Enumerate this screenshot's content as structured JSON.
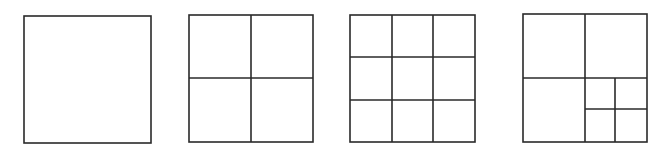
{
  "diagram": {
    "stroke_color": "#2a2a2a",
    "background_color": "#ffffff",
    "panels": [
      {
        "id": "square-1",
        "label": "undivided",
        "x": 24,
        "y": 16,
        "w": 127,
        "h": 127,
        "grid": "1x1",
        "lines": []
      },
      {
        "id": "square-2",
        "label": "2x2 grid",
        "x": 189,
        "y": 15,
        "w": 124,
        "h": 127,
        "grid": "2x2",
        "lines": [
          {
            "x1": 251,
            "y1": 15,
            "x2": 251,
            "y2": 142
          },
          {
            "x1": 189,
            "y1": 78,
            "x2": 313,
            "y2": 78
          }
        ]
      },
      {
        "id": "square-3",
        "label": "3x3 grid",
        "x": 350,
        "y": 15,
        "w": 125,
        "h": 127,
        "grid": "3x3",
        "lines": [
          {
            "x1": 392,
            "y1": 15,
            "x2": 392,
            "y2": 142
          },
          {
            "x1": 433,
            "y1": 15,
            "x2": 433,
            "y2": 142
          },
          {
            "x1": 350,
            "y1": 57,
            "x2": 475,
            "y2": 57
          },
          {
            "x1": 350,
            "y1": 100,
            "x2": 475,
            "y2": 100
          }
        ]
      },
      {
        "id": "square-4",
        "label": "2x2 grid with bottom-right quadrant subdivided 2x2",
        "x": 523,
        "y": 14,
        "w": 124,
        "h": 128,
        "grid": "2x2 + nested 2x2",
        "lines": [
          {
            "x1": 585,
            "y1": 14,
            "x2": 585,
            "y2": 142
          },
          {
            "x1": 523,
            "y1": 78,
            "x2": 647,
            "y2": 78
          },
          {
            "x1": 615,
            "y1": 78,
            "x2": 615,
            "y2": 142
          },
          {
            "x1": 585,
            "y1": 109,
            "x2": 647,
            "y2": 109
          }
        ]
      }
    ]
  }
}
